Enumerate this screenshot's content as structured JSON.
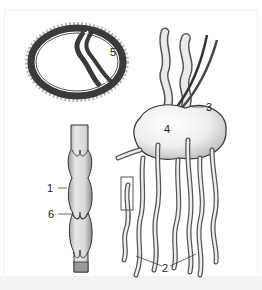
{
  "figure": {
    "labels": [
      {
        "id": "1",
        "text": "1",
        "target": "lymphatic vessel wall"
      },
      {
        "id": "2",
        "text": "2",
        "target": "afferent lymphatic vessels"
      },
      {
        "id": "3",
        "text": "3",
        "target": "efferent lymphatic vessel"
      },
      {
        "id": "4",
        "text": "4",
        "target": "lymph node"
      },
      {
        "id": "5",
        "text": "5",
        "target": "cross-section of vessel with valve"
      },
      {
        "id": "6",
        "text": "6",
        "target": "valve"
      }
    ],
    "colors": {
      "background": "#ffffff",
      "ink": "#333333",
      "shading": "#d6d6d6",
      "vessel_fill": "#e8e8e8",
      "blood_vessel": "#444444"
    }
  }
}
